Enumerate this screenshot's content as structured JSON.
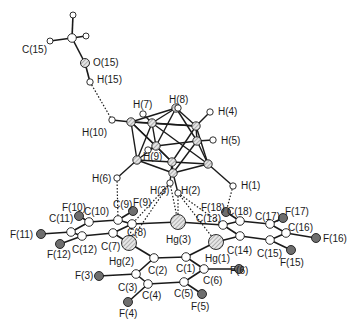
{
  "diagram": {
    "type": "molecular-structure",
    "atoms": [
      {
        "id": "C15",
        "label": "C(15)",
        "x": 72,
        "y": 38,
        "lx": 22,
        "ly": 45,
        "kind": "C"
      },
      {
        "id": "O15",
        "label": "O(15)",
        "x": 85,
        "y": 63,
        "lx": 93,
        "ly": 58,
        "kind": "O"
      },
      {
        "id": "H15",
        "label": "H(15)",
        "x": 90,
        "y": 82,
        "lx": 97,
        "ly": 75,
        "kind": "H"
      },
      {
        "id": "H8",
        "label": "H(8)",
        "x": 178,
        "y": 108,
        "lx": 169,
        "ly": 95,
        "kind": "H"
      },
      {
        "id": "H7",
        "label": "H(7)",
        "x": 143,
        "y": 114,
        "lx": 133,
        "ly": 100,
        "kind": "H"
      },
      {
        "id": "H4",
        "label": "H(4)",
        "x": 210,
        "y": 112,
        "lx": 218,
        "ly": 107,
        "kind": "H"
      },
      {
        "id": "H5",
        "label": "H(5)",
        "x": 213,
        "y": 140,
        "lx": 221,
        "ly": 136,
        "kind": "H"
      },
      {
        "id": "H10",
        "label": "H(10)",
        "x": 112,
        "y": 120,
        "lx": 82,
        "ly": 128,
        "kind": "H"
      },
      {
        "id": "H9",
        "label": "H(9)",
        "x": 148,
        "y": 150,
        "lx": 143,
        "ly": 152,
        "kind": "H"
      },
      {
        "id": "H6",
        "label": "H(6)",
        "x": 117,
        "y": 178,
        "lx": 92,
        "ly": 174,
        "kind": "H"
      },
      {
        "id": "H3",
        "label": "H(3)",
        "x": 170,
        "y": 183,
        "lx": 150,
        "ly": 186,
        "kind": "H"
      },
      {
        "id": "H2",
        "label": "H(2)",
        "x": 178,
        "y": 193,
        "lx": 181,
        "ly": 186,
        "kind": "H"
      },
      {
        "id": "H1",
        "label": "H(1)",
        "x": 233,
        "y": 186,
        "lx": 241,
        "ly": 181,
        "kind": "H"
      },
      {
        "id": "Hg3",
        "label": "Hg(3)",
        "x": 178,
        "y": 222,
        "lx": 166,
        "ly": 235,
        "kind": "Hg"
      },
      {
        "id": "Hg2",
        "label": "Hg(2)",
        "x": 129,
        "y": 243,
        "lx": 109,
        "ly": 257,
        "kind": "Hg"
      },
      {
        "id": "Hg1",
        "label": "Hg(1)",
        "x": 216,
        "y": 242,
        "lx": 205,
        "ly": 254,
        "kind": "Hg"
      },
      {
        "id": "F9",
        "label": "F(9)",
        "x": 133,
        "y": 211,
        "lx": 133,
        "ly": 198,
        "kind": "F"
      },
      {
        "id": "F10",
        "label": "F(10)",
        "x": 79,
        "y": 216,
        "lx": 62,
        "ly": 203,
        "kind": "F"
      },
      {
        "id": "F11",
        "label": "F(11)",
        "x": 41,
        "y": 234,
        "lx": 10,
        "ly": 230,
        "kind": "F"
      },
      {
        "id": "F12",
        "label": "F(12)",
        "x": 60,
        "y": 244,
        "lx": 47,
        "ly": 250,
        "kind": "F"
      },
      {
        "id": "F18",
        "label": "F(18)",
        "x": 226,
        "y": 212,
        "lx": 201,
        "ly": 203,
        "kind": "F"
      },
      {
        "id": "F17",
        "label": "F(17)",
        "x": 283,
        "y": 218,
        "lx": 285,
        "ly": 207,
        "kind": "F"
      },
      {
        "id": "F16",
        "label": "F(16)",
        "x": 316,
        "y": 238,
        "lx": 323,
        "ly": 234,
        "kind": "F"
      },
      {
        "id": "F15",
        "label": "F(15)",
        "x": 291,
        "y": 250,
        "lx": 280,
        "ly": 258,
        "kind": "F"
      },
      {
        "id": "F3",
        "label": "F(3)",
        "x": 99,
        "y": 276,
        "lx": 75,
        "ly": 271,
        "kind": "F"
      },
      {
        "id": "F4",
        "label": "F(4)",
        "x": 128,
        "y": 302,
        "lx": 119,
        "ly": 309,
        "kind": "F"
      },
      {
        "id": "F5",
        "label": "F(5)",
        "x": 202,
        "y": 294,
        "lx": 191,
        "ly": 302,
        "kind": "F"
      },
      {
        "id": "F6",
        "label": "F(6)",
        "x": 239,
        "y": 269,
        "lx": 230,
        "ly": 266,
        "kind": "F"
      },
      {
        "id": "C9",
        "label": "C(9)",
        "x": 118,
        "y": 220,
        "lx": 113,
        "ly": 200,
        "kind": "C"
      },
      {
        "id": "C10",
        "label": "C(10)",
        "x": 89,
        "y": 222,
        "lx": 84,
        "ly": 207,
        "kind": "C"
      },
      {
        "id": "C11",
        "label": "C(11)",
        "x": 71,
        "y": 232,
        "lx": 49,
        "ly": 214,
        "kind": "C"
      },
      {
        "id": "C12",
        "label": "C(12)",
        "x": 82,
        "y": 236,
        "lx": 72,
        "ly": 245,
        "kind": "C"
      },
      {
        "id": "C7",
        "label": "C(7)",
        "x": 113,
        "y": 233,
        "lx": 101,
        "ly": 242,
        "kind": "C"
      },
      {
        "id": "C8",
        "label": "C(8)",
        "x": 132,
        "y": 224,
        "lx": 127,
        "ly": 228,
        "kind": "C"
      },
      {
        "id": "C13",
        "label": "C(13)",
        "x": 223,
        "y": 225,
        "lx": 196,
        "ly": 214,
        "kind": "C"
      },
      {
        "id": "C18",
        "label": "C(18)",
        "x": 240,
        "y": 221,
        "lx": 227,
        "ly": 207,
        "kind": "C"
      },
      {
        "id": "C17",
        "label": "C(17)",
        "x": 270,
        "y": 224,
        "lx": 255,
        "ly": 212,
        "kind": "C"
      },
      {
        "id": "C16",
        "label": "C(16)",
        "x": 286,
        "y": 233,
        "lx": 288,
        "ly": 223,
        "kind": "C"
      },
      {
        "id": "C15r",
        "label": "C(15)",
        "x": 270,
        "y": 240,
        "lx": 257,
        "ly": 249,
        "kind": "C"
      },
      {
        "id": "C14",
        "label": "C(14)",
        "x": 240,
        "y": 236,
        "lx": 227,
        "ly": 246,
        "kind": "C"
      },
      {
        "id": "C2",
        "label": "C(2)",
        "x": 154,
        "y": 258,
        "lx": 148,
        "ly": 266,
        "kind": "C"
      },
      {
        "id": "C1",
        "label": "C(1)",
        "x": 186,
        "y": 257,
        "lx": 176,
        "ly": 264,
        "kind": "C"
      },
      {
        "id": "C6",
        "label": "C(6)",
        "x": 204,
        "y": 269,
        "lx": 203,
        "ly": 276,
        "kind": "C"
      },
      {
        "id": "C5",
        "label": "C(5)",
        "x": 184,
        "y": 282,
        "lx": 174,
        "ly": 289,
        "kind": "C"
      },
      {
        "id": "C4",
        "label": "C(4)",
        "x": 148,
        "y": 284,
        "lx": 142,
        "ly": 291,
        "kind": "C"
      },
      {
        "id": "C3",
        "label": "C(3)",
        "x": 136,
        "y": 274,
        "lx": 118,
        "ly": 283,
        "kind": "C"
      }
    ],
    "cage_atoms": [
      {
        "x": 176,
        "y": 108
      },
      {
        "x": 152,
        "y": 123
      },
      {
        "x": 131,
        "y": 122
      },
      {
        "x": 196,
        "y": 126
      },
      {
        "x": 197,
        "y": 141
      },
      {
        "x": 156,
        "y": 146
      },
      {
        "x": 137,
        "y": 160
      },
      {
        "x": 172,
        "y": 162
      },
      {
        "x": 208,
        "y": 164
      },
      {
        "x": 173,
        "y": 173
      }
    ],
    "methyl_h": [
      {
        "x": 73,
        "y": 15
      },
      {
        "x": 50,
        "y": 41
      },
      {
        "x": 86,
        "y": 36
      }
    ],
    "colors": {
      "hg_fill": "#cfcfcf",
      "f_fill": "#6e6e6e",
      "line": "#1a1a1a",
      "background": "#ffffff"
    }
  }
}
